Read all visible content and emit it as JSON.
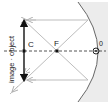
{
  "diagram": {
    "labels": {
      "center": "C",
      "focus": "F",
      "pole": "0",
      "vertical_label": "image · object",
      "image": "image",
      "object": "object"
    },
    "colors": {
      "mirror_fill": "#ececec",
      "mirror_line": "#666666",
      "ray": "#b9b9b9",
      "axis": "#555555",
      "arrow": "#111111"
    }
  }
}
